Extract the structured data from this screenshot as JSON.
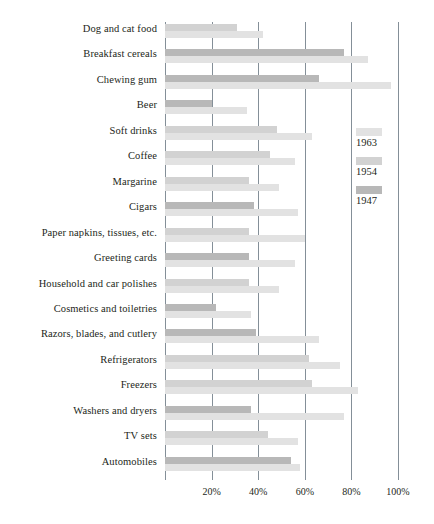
{
  "chart_data": {
    "type": "bar",
    "orientation": "horizontal",
    "title": "",
    "xlabel": "",
    "ylabel": "",
    "xlim": [
      0,
      100
    ],
    "xticks": [
      20,
      40,
      60,
      80,
      100
    ],
    "xticklabels": [
      "20%",
      "40%",
      "60%",
      "80%",
      "100%"
    ],
    "grid": true,
    "legend_position": "right",
    "categories": [
      "Dog and cat food",
      "Breakfast cereals",
      "Chewing gum",
      "Beer",
      "Soft drinks",
      "Coffee",
      "Margarine",
      "Cigars",
      "Paper napkins, tissues, etc.",
      "Greeting cards",
      "Household and car polishes",
      "Cosmetics and toiletries",
      "Razors, blades, and cutlery",
      "Refrigerators",
      "Freezers",
      "Washers and dryers",
      "TV sets",
      "Automobiles"
    ],
    "series": [
      {
        "name": "1947",
        "color": "#b8b8b8",
        "values": [
          0,
          77,
          66,
          20,
          0,
          0,
          0,
          38,
          0,
          36,
          0,
          22,
          39,
          0,
          0,
          37,
          0,
          54
        ]
      },
      {
        "name": "1954",
        "color": "#d2d2d2",
        "values": [
          31,
          0,
          0,
          0,
          48,
          45,
          36,
          0,
          36,
          0,
          36,
          0,
          0,
          62,
          63,
          0,
          44,
          0
        ]
      },
      {
        "name": "1963",
        "color": "#e2e2e2",
        "values": [
          42,
          87,
          97,
          35,
          63,
          56,
          49,
          57,
          60,
          56,
          49,
          37,
          66,
          75,
          83,
          77,
          57,
          58
        ]
      }
    ]
  },
  "legend": {
    "items": [
      {
        "label": "1963",
        "swatch_class": "y1963"
      },
      {
        "label": "1954",
        "swatch_class": "y1954"
      },
      {
        "label": "1947",
        "swatch_class": "y1947"
      }
    ]
  },
  "colors": {
    "y1963": "#e2e2e2",
    "y1954": "#d2d2d2",
    "y1947": "#b8b8b8",
    "gridline": "#6f7b86",
    "text": "#231f20",
    "background": "#ffffff"
  }
}
